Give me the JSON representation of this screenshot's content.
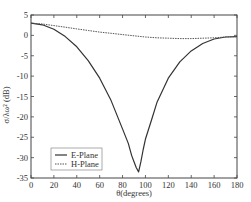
{
  "chart_data": {
    "type": "line",
    "title": "",
    "xlabel": "θ(degrees)",
    "ylabel": "σ/λω² (dB)",
    "xlim": [
      0,
      180
    ],
    "ylim": [
      -35,
      5
    ],
    "xticks": [
      0,
      20,
      40,
      60,
      80,
      100,
      120,
      140,
      160,
      180
    ],
    "yticks": [
      5,
      0,
      -5,
      -10,
      -15,
      -20,
      -25,
      -30,
      -35
    ],
    "grid": false,
    "legend_position": "lower left",
    "series": [
      {
        "name": "E-Plane",
        "style": "solid",
        "color": "#333333",
        "x": [
          0,
          10,
          20,
          30,
          40,
          50,
          60,
          70,
          80,
          85,
          88,
          90,
          92,
          94,
          96,
          98,
          100,
          105,
          110,
          120,
          130,
          140,
          150,
          160,
          170,
          180
        ],
        "y": [
          3,
          2.6,
          1.5,
          -0.3,
          -2.8,
          -6.2,
          -10.5,
          -16,
          -23,
          -26.5,
          -29.5,
          -31,
          -32.5,
          -33.5,
          -31,
          -28,
          -25.5,
          -21,
          -16.5,
          -10.5,
          -6.5,
          -3.8,
          -2,
          -0.9,
          -0.4,
          -0.3
        ]
      },
      {
        "name": "H-Plane",
        "style": "dashed",
        "color": "#555555",
        "x": [
          0,
          10,
          20,
          30,
          40,
          50,
          60,
          70,
          80,
          90,
          100,
          110,
          120,
          130,
          140,
          150,
          160,
          170,
          180
        ],
        "y": [
          3,
          2.8,
          2.4,
          2.0,
          1.6,
          1.2,
          0.8,
          0.5,
          0.2,
          -0.1,
          -0.4,
          -0.6,
          -0.7,
          -0.8,
          -0.8,
          -0.7,
          -0.6,
          -0.4,
          -0.3
        ]
      }
    ]
  },
  "axes": {
    "x_tick_labels": [
      "0",
      "20",
      "40",
      "60",
      "80",
      "100",
      "120",
      "140",
      "160",
      "180"
    ],
    "y_tick_labels": [
      "5",
      "0",
      "-5",
      "-10",
      "-15",
      "-20",
      "-25",
      "-30",
      "-35"
    ],
    "x_label": "θ(degrees)",
    "y_label": "σ/λω² (dB)"
  },
  "legend": {
    "items": [
      {
        "label": "E-Plane",
        "style": "solid"
      },
      {
        "label": "H-Plane",
        "style": "dashed"
      }
    ]
  }
}
